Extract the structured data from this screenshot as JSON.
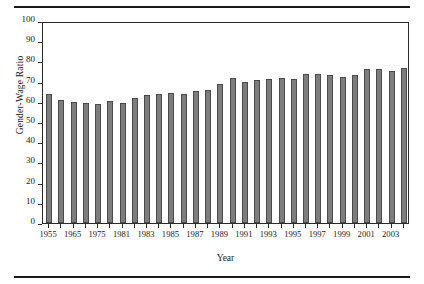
{
  "figure": {
    "background_color": "#ffffff",
    "rule_color": "#1a1a1a",
    "frame_color": "#2b2b2b"
  },
  "chart_data": {
    "type": "bar",
    "title": "",
    "xlabel": "Year",
    "ylabel": "Gender-Wage Ratio",
    "ylim": [
      0,
      100
    ],
    "ytick_values": [
      0,
      10,
      20,
      30,
      40,
      50,
      60,
      70,
      80,
      90,
      100
    ],
    "ytick_labels": [
      "0",
      "10",
      "20",
      "30",
      "40",
      "50",
      "60",
      "70",
      "80",
      "90",
      "100"
    ],
    "grid": false,
    "legend": false,
    "bar_color": "#7d7d7d",
    "bar_edge_color": "#4a4a4a",
    "visible_xtick_labels": [
      "1955",
      "1965",
      "1975",
      "1981",
      "1983",
      "1985",
      "1987",
      "1989",
      "1991",
      "1993",
      "1995",
      "1997",
      "1999",
      "2001",
      "2003"
    ],
    "categories": [
      "1955",
      "1960",
      "1965",
      "1970",
      "1975",
      "1978",
      "1981",
      "1982",
      "1983",
      "1984",
      "1985",
      "1986",
      "1987",
      "1988",
      "1989",
      "1990",
      "1991",
      "1992",
      "1993",
      "1994",
      "1995",
      "1996",
      "1997",
      "1998",
      "1999",
      "2000",
      "2001",
      "2002",
      "2003",
      "2004"
    ],
    "values": [
      64.0,
      60.8,
      59.9,
      59.4,
      58.8,
      60.2,
      59.2,
      61.7,
      63.6,
      63.7,
      64.6,
      64.1,
      65.2,
      66.0,
      68.7,
      71.6,
      69.6,
      70.6,
      71.5,
      72.0,
      71.4,
      73.8,
      74.0,
      73.2,
      72.2,
      73.3,
      76.3,
      76.3,
      75.5,
      76.5
    ],
    "x_positions": [
      0,
      1,
      2,
      3,
      4,
      5,
      6,
      7,
      8,
      9,
      10,
      11,
      12,
      13,
      14,
      15,
      16,
      17,
      18,
      19,
      20,
      21,
      22,
      23,
      24,
      25,
      26,
      27,
      28,
      29
    ]
  }
}
